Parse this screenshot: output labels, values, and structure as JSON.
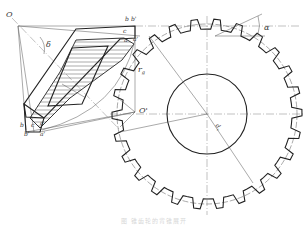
{
  "figure": {
    "type": "technical-drawing",
    "caption": "图  锥齿轮的背锥展开"
  },
  "labels": {
    "apex": "O",
    "apex_back": "O'",
    "b": "b",
    "b_prime": "b'",
    "c": "c",
    "a": "a",
    "a_prime": "a'",
    "delta": "δ",
    "r_g": "r",
    "r_g_sub": "g",
    "alpha": "α",
    "d_v": "d",
    "d_v_sub": "v",
    "d_v_den": "2",
    "b_low": "b",
    "b_prime_low": "b'",
    "c_low": "c",
    "a_low": "a",
    "a_prime_low": "a'"
  },
  "gear": {
    "center": [
      207,
      114
    ],
    "tip_radius": 95,
    "root_radius": 85,
    "pitch_radius": 90,
    "bore_radius": 40,
    "teeth": 26
  },
  "colors": {
    "line": "#222222",
    "thin": "#555555",
    "background": "#ffffff"
  }
}
